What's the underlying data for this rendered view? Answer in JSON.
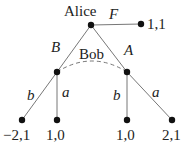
{
  "diagram": {
    "type": "game-tree",
    "root": {
      "player": "Alice"
    },
    "info_set_label": "Bob",
    "edges": {
      "F": "F",
      "B": "B",
      "A": "A",
      "left_b": "b",
      "left_a": "a",
      "right_b": "b",
      "right_a": "a"
    },
    "payoffs": {
      "F": "1,1",
      "Bb": "−2,1",
      "Ba": "1,0",
      "Ab": "1,0",
      "Aa": "2,1"
    },
    "colors": {
      "line": "#777777",
      "node": "#111111",
      "text": "#222222"
    }
  }
}
